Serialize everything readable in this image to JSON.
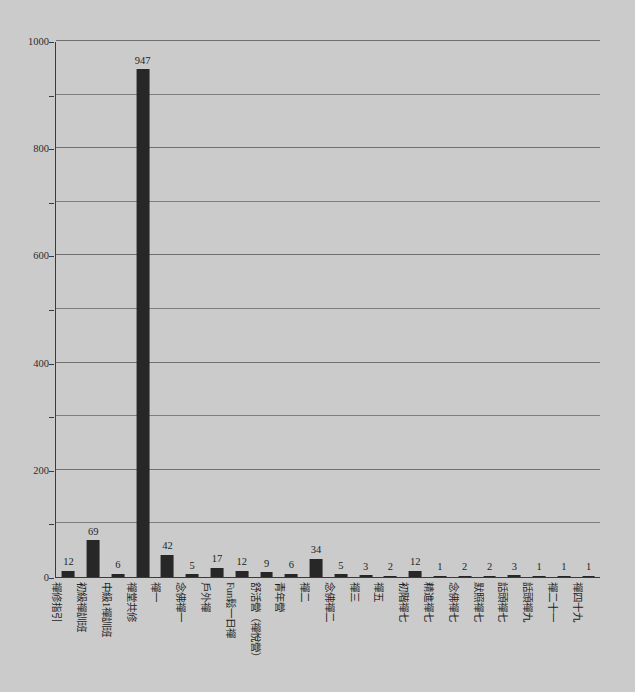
{
  "figure": {
    "background_color": "#cbcbcb",
    "bar_color": "#272727",
    "axis_color": "#3a3a3a",
    "gridline_color": "#6f6f6f",
    "clipped_header_text": ""
  },
  "chart_data": {
    "type": "bar",
    "title": "",
    "subtitle": "",
    "xlabel": "",
    "ylabel": "",
    "ylim": [
      0,
      1000
    ],
    "grid": true,
    "legend": false,
    "legend_position": "none",
    "yticks": [
      0,
      200,
      400,
      600,
      800,
      1000
    ],
    "ytick_labels": [
      "0",
      "200",
      "400",
      "600",
      "800",
      "1000"
    ],
    "minor_tick_step": 100,
    "categories": [
      "禪修指引",
      "初級禪訓班",
      "中級1禪訓班",
      "禪堂共修",
      "禪一",
      "念佛禪一",
      "戶外禪",
      "Fun鬆一日禪",
      "舒活營（禪悅營）",
      "青年營",
      "禪二",
      "念佛禪二",
      "禪三",
      "禪五",
      "初階禪七",
      "精進禪七",
      "念佛禪七",
      "默照禪七",
      "話頭禪七",
      "話頭禪九",
      "禪二十一",
      "禪四十九"
    ],
    "values": [
      12,
      69,
      6,
      947,
      42,
      5,
      17,
      12,
      9,
      6,
      34,
      5,
      3,
      2,
      12,
      1,
      2,
      2,
      3,
      1,
      1,
      1
    ],
    "data_labels": [
      "12",
      "69",
      "6",
      "947",
      "42",
      "5",
      "17",
      "12",
      "9",
      "6",
      "34",
      "5",
      "3",
      "2",
      "12",
      "1",
      "2",
      "2",
      "3",
      "1",
      "1",
      "1"
    ]
  }
}
